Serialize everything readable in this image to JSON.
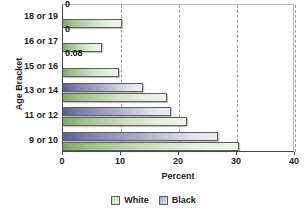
{
  "chart_data": {
    "type": "bar",
    "orientation": "horizontal",
    "title": "",
    "xlabel": "Percent",
    "ylabel": "Age Bracket",
    "xlim": [
      0,
      40
    ],
    "xticks": [
      0,
      10,
      20,
      30,
      40
    ],
    "xtick_labels": [
      "0",
      "10",
      "20",
      "30",
      "40"
    ],
    "grid": "vertical-dashed",
    "legend_position": "bottom-center",
    "categories": [
      "18 or 19",
      "16 or 17",
      "15 or 16",
      "13 or 14",
      "11 or 12",
      "9 or 10"
    ],
    "series": [
      {
        "name": "White",
        "color": "#cfe0c0",
        "values": [
          10.2,
          6.8,
          9.7,
          18.0,
          21.4,
          30.3
        ],
        "labels": [
          "",
          "",
          "",
          "",
          "",
          ""
        ]
      },
      {
        "name": "Black",
        "color": "#b4b7cf",
        "values": [
          0,
          0,
          0.08,
          13.8,
          18.6,
          26.8
        ],
        "labels": [
          "0",
          "0",
          "0.08",
          "",
          "",
          ""
        ]
      }
    ]
  },
  "legend": {
    "items": [
      {
        "label": "White",
        "swatch": "white"
      },
      {
        "label": "Black",
        "swatch": "black"
      }
    ]
  },
  "axes": {
    "x_title": "Percent",
    "y_title": "Age Bracket"
  }
}
